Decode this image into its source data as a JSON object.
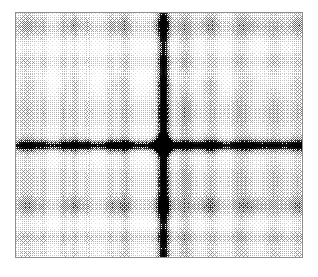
{
  "figure": {
    "title": "",
    "background_color": "#ffffff",
    "width": 318,
    "height": 277
  },
  "plot_area": {
    "name": "spectrum-plot",
    "left": 15,
    "top": 12,
    "width": 288,
    "height": 246,
    "border_color": "#8e8e8e",
    "border_width": 1,
    "fill_color": "#ffffff",
    "has_axis_ticks": false,
    "has_axis_labels": false,
    "has_tick_labels": false,
    "has_colorbar": false,
    "has_legend": false,
    "has_title": false
  },
  "chart_data": {
    "type": "heatmap",
    "title": "",
    "subtitle": "",
    "xlabel": "",
    "ylabel": "",
    "xticklabels": [],
    "yticklabels": [],
    "legend": [],
    "annotations": [],
    "grid": false,
    "legend_position": "none",
    "colormap": {
      "name": "gray-inverted",
      "low_value_color": "#ffffff",
      "high_value_color": "#000000",
      "rendering": "halftone-dither"
    },
    "value_range": [
      0,
      1
    ],
    "value_units": "normalized log magnitude",
    "xlim": [
      -1,
      1
    ],
    "ylim": [
      -1,
      1
    ],
    "grid_size": [
      288,
      246
    ],
    "dc_peak": {
      "x_px": 148,
      "y_px": 133,
      "x_norm": 0.514,
      "y_norm": 0.541,
      "intensity": 1.0,
      "radius_px": 6
    },
    "dc_lines": [
      {
        "orientation": "vertical",
        "position_px": 148,
        "position_norm": 0.514,
        "intensity": 0.5,
        "half_width_px": 4
      },
      {
        "orientation": "horizontal",
        "position_px": 133,
        "position_norm": 0.541,
        "intensity": 0.48,
        "half_width_px": 3
      }
    ],
    "horizontal_bands": [
      {
        "center_px": 14,
        "half_height_px": 13,
        "intensity": 0.3
      },
      {
        "center_px": 48,
        "half_height_px": 9,
        "intensity": 0.22
      },
      {
        "center_px": 100,
        "half_height_px": 22,
        "intensity": 0.26
      },
      {
        "center_px": 133,
        "half_height_px": 7,
        "intensity": 0.34
      },
      {
        "center_px": 168,
        "half_height_px": 20,
        "intensity": 0.24
      },
      {
        "center_px": 196,
        "half_height_px": 11,
        "intensity": 0.25
      },
      {
        "center_px": 226,
        "half_height_px": 8,
        "intensity": 0.3
      },
      {
        "center_px": 242,
        "half_height_px": 6,
        "intensity": 0.18
      }
    ],
    "vertical_bands": [
      {
        "center_px": 10,
        "half_width_px": 9,
        "intensity": 0.16
      },
      {
        "center_px": 110,
        "half_width_px": 5,
        "intensity": 0.2
      },
      {
        "center_px": 148,
        "half_width_px": 5,
        "intensity": 0.4
      },
      {
        "center_px": 170,
        "half_width_px": 7,
        "intensity": 0.28
      },
      {
        "center_px": 196,
        "half_width_px": 6,
        "intensity": 0.18
      },
      {
        "center_px": 226,
        "half_width_px": 9,
        "intensity": 0.22
      },
      {
        "center_px": 260,
        "half_width_px": 9,
        "intensity": 0.2
      },
      {
        "center_px": 284,
        "half_width_px": 7,
        "intensity": 0.18
      }
    ],
    "stripes_left": [
      {
        "center_px": 27,
        "half_width_px": 3,
        "intensity": 0.14
      },
      {
        "center_px": 47,
        "half_width_px": 3,
        "intensity": 0.16
      },
      {
        "center_px": 58,
        "half_width_px": 3,
        "intensity": 0.15
      },
      {
        "center_px": 72,
        "half_width_px": 3,
        "intensity": 0.14
      },
      {
        "center_px": 95,
        "half_width_px": 3,
        "intensity": 0.13
      }
    ],
    "harmonic_lattice": {
      "x_period_px": 45,
      "y_period_px": 62,
      "blob_width_px": 20,
      "blob_height_px": 18,
      "peak_intensity": 0.22,
      "origin_x_px": 148,
      "origin_y_px": 133
    },
    "noise_floor": 0.015,
    "dither": {
      "type": "ordered-bayer",
      "matrix_size": 4,
      "cell_px": 1
    }
  }
}
